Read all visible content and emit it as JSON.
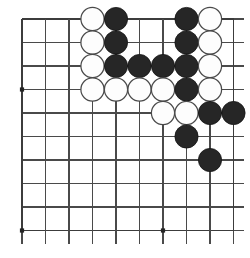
{
  "figure": {
    "kind": "go-board-diagram",
    "board": {
      "visible_columns": 10,
      "visible_rows": 10,
      "corner_shown": "top-left",
      "origin_x": 22,
      "origin_y": 19,
      "spacing": 23.5,
      "line_color": "#4a4a4a",
      "edge_line_color": "#3c3c3c",
      "background_color": "#ffffff",
      "cropped_edges": [
        "right",
        "bottom"
      ]
    },
    "star_points": [
      {
        "col": 1,
        "row": 4
      },
      {
        "col": 1,
        "row": 10
      },
      {
        "col": 7,
        "row": 10
      }
    ],
    "stones": [
      {
        "color": "white",
        "col": 4,
        "row": 1
      },
      {
        "color": "black",
        "col": 5,
        "row": 1
      },
      {
        "color": "black",
        "col": 8,
        "row": 1
      },
      {
        "color": "white",
        "col": 9,
        "row": 1
      },
      {
        "color": "white",
        "col": 4,
        "row": 2
      },
      {
        "color": "black",
        "col": 5,
        "row": 2
      },
      {
        "color": "black",
        "col": 8,
        "row": 2
      },
      {
        "color": "white",
        "col": 9,
        "row": 2
      },
      {
        "color": "white",
        "col": 4,
        "row": 3
      },
      {
        "color": "black",
        "col": 5,
        "row": 3
      },
      {
        "color": "black",
        "col": 6,
        "row": 3
      },
      {
        "color": "black",
        "col": 7,
        "row": 3
      },
      {
        "color": "black",
        "col": 8,
        "row": 3
      },
      {
        "color": "white",
        "col": 9,
        "row": 3
      },
      {
        "color": "white",
        "col": 4,
        "row": 4
      },
      {
        "color": "white",
        "col": 5,
        "row": 4
      },
      {
        "color": "white",
        "col": 6,
        "row": 4
      },
      {
        "color": "white",
        "col": 7,
        "row": 4
      },
      {
        "color": "black",
        "col": 8,
        "row": 4
      },
      {
        "color": "white",
        "col": 9,
        "row": 4
      },
      {
        "color": "white",
        "col": 7,
        "row": 5
      },
      {
        "color": "white",
        "col": 8,
        "row": 5
      },
      {
        "color": "black",
        "col": 9,
        "row": 5
      },
      {
        "color": "black",
        "col": 10,
        "row": 5
      },
      {
        "color": "black",
        "col": 8,
        "row": 6
      },
      {
        "color": "black",
        "col": 9,
        "row": 7
      }
    ],
    "stone_counts": {
      "black": 14,
      "white": 12,
      "total": 26
    },
    "colors": {
      "black_stone": "#262626",
      "black_stone_outline": "#151515",
      "white_stone": "#fdfdfd",
      "white_stone_outline": "#4a4a4a",
      "star_point": "#242424"
    },
    "stone_radius": 11.6
  }
}
